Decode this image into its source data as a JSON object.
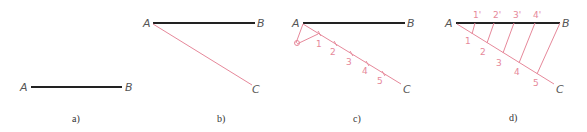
{
  "figure": {
    "colors": {
      "segment": "#222222",
      "construction": "#e6889a",
      "labels": "#555555"
    },
    "panels": [
      {
        "caption": "a)",
        "points": {
          "A": "A",
          "B": "B"
        }
      },
      {
        "caption": "b)",
        "points": {
          "A": "A",
          "B": "B",
          "C": "C"
        }
      },
      {
        "caption": "c)",
        "points": {
          "A": "A",
          "B": "B",
          "C": "C"
        },
        "divisions": [
          "1",
          "2",
          "3",
          "4",
          "5"
        ]
      },
      {
        "caption": "d)",
        "points": {
          "A": "A",
          "B": "B",
          "C": "C"
        },
        "divisions": [
          "1",
          "2",
          "3",
          "4",
          "5"
        ],
        "projected": [
          "1'",
          "2'",
          "3'",
          "4'"
        ]
      }
    ]
  }
}
